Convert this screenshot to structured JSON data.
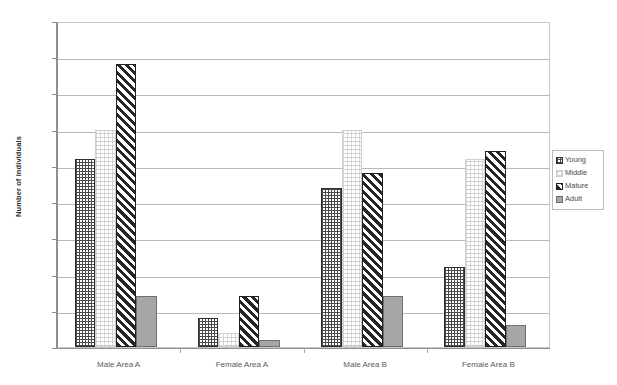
{
  "chart_data": {
    "type": "bar",
    "title": "",
    "xlabel": "",
    "ylabel": "Number of individuals",
    "ylim": [
      0,
      45
    ],
    "ytick_step": 5,
    "grid": true,
    "legend_position": "right",
    "categories": [
      "Male Area A",
      "Female Area A",
      "Male Area B",
      "Female Area B"
    ],
    "series": [
      {
        "name": "Young",
        "pattern": "cross-hatch",
        "values": [
          26,
          4,
          22,
          11
        ]
      },
      {
        "name": "Middle",
        "pattern": "light-dotted",
        "values": [
          30,
          2,
          30,
          26
        ]
      },
      {
        "name": "Mature",
        "pattern": "diagonal-hatch",
        "values": [
          39,
          7,
          24,
          27
        ]
      },
      {
        "name": "Adult",
        "pattern": "solid-gray",
        "values": [
          7,
          1,
          7,
          3
        ]
      }
    ],
    "ytick_labels": [
      "0",
      "5",
      "10",
      "15",
      "20",
      "25",
      "30",
      "35",
      "40",
      "45"
    ]
  },
  "axis": {
    "y_title": "Number of individuals"
  },
  "legend": {
    "items": [
      {
        "label": "Young"
      },
      {
        "label": "Middle"
      },
      {
        "label": "Mature"
      },
      {
        "label": "Adult"
      }
    ]
  },
  "colors": {
    "adult_fill": "#a6a6a6",
    "hatch_dark": "#262626",
    "gridline": "#b9b9b9",
    "axis": "#8f8f8f",
    "tick_text": "#6d6d6d"
  }
}
